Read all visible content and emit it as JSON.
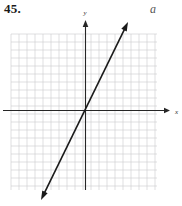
{
  "figure": {
    "problem_number": "45.",
    "part_label": "a",
    "width": 182,
    "height": 206
  },
  "axes": {
    "x_label": "x",
    "y_label": "y",
    "origin_px": {
      "x": 85.5,
      "y": 110.5
    },
    "axis_color": "#262626",
    "x_axis_start_px": 3,
    "x_axis_end_px": 170,
    "y_axis_top_px": 20,
    "y_axis_bottom_px": 190
  },
  "grid": {
    "color": "#c9c9cf",
    "cell_size_px": 8,
    "left_px": 11,
    "top_px": 34,
    "right_px": 157,
    "bottom_px": 190,
    "cols": 18,
    "rows": 19,
    "visible": true
  },
  "chart_data": {
    "type": "line",
    "title": "",
    "subtitle": "",
    "xlabel": "x",
    "ylabel": "y",
    "xlim": [
      -9,
      9
    ],
    "ylim": [
      -10,
      9.5
    ],
    "grid": true,
    "legend": "none",
    "annotations": [
      "45.",
      "a"
    ],
    "series": [
      {
        "name": "line",
        "equation": "y = 2x",
        "slope": 2,
        "intercept": 0,
        "style": "double-headed arrow",
        "color": "#1a1a1a",
        "x": [
          -5.5,
          5.25
        ],
        "values": [
          -11.0,
          10.5
        ],
        "endpoints_px": [
          {
            "x": 41,
            "y": 200
          },
          {
            "x": 128,
            "y": 22
          }
        ]
      }
    ]
  }
}
